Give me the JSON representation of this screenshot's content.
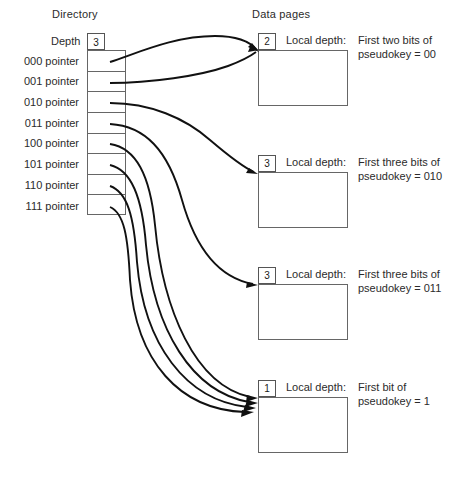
{
  "diagram": {
    "directory_title": "Directory",
    "pages_title": "Data pages",
    "depth_label": "Depth",
    "global_depth": "3",
    "directory_entries": [
      {
        "label": "000 pointer",
        "target_page": 0
      },
      {
        "label": "001 pointer",
        "target_page": 0
      },
      {
        "label": "010 pointer",
        "target_page": 1
      },
      {
        "label": "011 pointer",
        "target_page": 2
      },
      {
        "label": "100 pointer",
        "target_page": 3
      },
      {
        "label": "101 pointer",
        "target_page": 3
      },
      {
        "label": "110 pointer",
        "target_page": 3
      },
      {
        "label": "111 pointer",
        "target_page": 3
      }
    ],
    "pages": [
      {
        "local_depth": "2",
        "local_depth_label": "Local depth:",
        "desc_line1": "First two bits of",
        "desc_line2": "pseudokey = 00"
      },
      {
        "local_depth": "3",
        "local_depth_label": "Local depth:",
        "desc_line1": "First three bits of",
        "desc_line2": "pseudokey = 010"
      },
      {
        "local_depth": "3",
        "local_depth_label": "Local depth:",
        "desc_line1": "First three bits of",
        "desc_line2": "pseudokey = 011"
      },
      {
        "local_depth": "1",
        "local_depth_label": "Local depth:",
        "desc_line1": "First bit of",
        "desc_line2": "pseudokey = 1"
      }
    ],
    "colors": {
      "line": "#111111",
      "box_border": "#666666",
      "background": "#ffffff",
      "text": "#2b2b2b"
    }
  }
}
